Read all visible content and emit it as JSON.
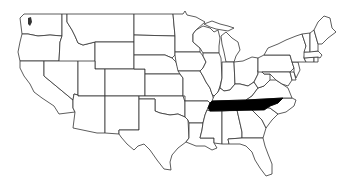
{
  "map": {
    "title": "United States map with Tennessee highlighted",
    "region": "Contiguous United States",
    "highlighted_state": "Tennessee",
    "colors": {
      "background": "#ffffff",
      "state_fill": "#ffffff",
      "state_border": "#333333",
      "highlight_fill": "#000000"
    },
    "states": [
      {
        "id": "WA",
        "name": "Washington",
        "d": "M20,18 L24,14 L62,14 L62,36 L50,35 L38,36 L28,34 L22,34 L21,26 Z"
      },
      {
        "id": "OR",
        "name": "Oregon",
        "d": "M22,34 L28,34 L38,36 L50,35 L62,36 L60,42 L59,61 L20,61 L18,52 L20,42 Z"
      },
      {
        "id": "CA",
        "name": "California",
        "d": "M20,61 L44,61 L44,76 L73,100 L73,108 L75,112 L59,114 L54,106 L42,98 L34,92 L30,84 L24,76 L20,68 Z"
      },
      {
        "id": "ID",
        "name": "Idaho",
        "d": "M62,14 L67,14 L67,22 L72,30 L75,36 L78,43 L83,45 L95,42 L95,69 L78,69 L59,69 L59,61 L60,42 L62,36 Z"
      },
      {
        "id": "NV",
        "name": "Nevada",
        "d": "M44,61 L59,61 L78,61 L78,95 L74,94 L73,100 L44,76 Z"
      },
      {
        "id": "MT",
        "name": "Montana",
        "d": "M67,14 L134,14 L134,42 L95,42 L83,45 L78,43 L75,36 L72,30 L67,22 Z"
      },
      {
        "id": "WY",
        "name": "Wyoming",
        "d": "M95,42 L134,42 L134,69 L95,69 Z"
      },
      {
        "id": "UT",
        "name": "Utah",
        "d": "M78,61 L95,61 L95,69 L105,69 L105,96 L78,96 Z"
      },
      {
        "id": "AZ",
        "name": "Arizona",
        "d": "M78,96 L105,96 L105,133 L97,133 L73,128 L75,112 L73,108 L73,100 L74,94 L78,95 Z"
      },
      {
        "id": "CO",
        "name": "Colorado",
        "d": "M105,69 L145,69 L145,96 L105,96 Z"
      },
      {
        "id": "NM",
        "name": "New Mexico",
        "d": "M105,96 L139,96 L139,130 L119,130 L119,134 L105,133 Z"
      },
      {
        "id": "ND",
        "name": "North Dakota",
        "d": "M134,14 L173,14 L175,36 L134,35 Z"
      },
      {
        "id": "SD",
        "name": "South Dakota",
        "d": "M134,35 L175,36 L175,55 L172,58 L165,55 L134,55 Z"
      },
      {
        "id": "NE",
        "name": "Nebraska",
        "d": "M134,55 L165,55 L172,58 L176,62 L180,74 L145,74 L145,69 L134,69 Z"
      },
      {
        "id": "KS",
        "name": "Kansas",
        "d": "M145,74 L180,74 L183,78 L183,96 L145,96 Z"
      },
      {
        "id": "OK",
        "name": "Oklahoma",
        "d": "M139,96 L183,96 L185,102 L185,117 L178,114 L170,115 L160,113 L155,111 L155,99 L139,99 Z"
      },
      {
        "id": "TX",
        "name": "Texas",
        "d": "M139,99 L155,99 L155,111 L160,113 L170,115 L178,114 L185,117 L188,120 L189,138 L186,142 L178,148 L172,155 L170,162 L171,170 L164,169 L157,160 L150,150 L144,144 L138,146 L134,150 L127,144 L121,137 L119,134 L119,130 L139,130 Z"
      },
      {
        "id": "MN",
        "name": "Minnesota",
        "d": "M173,14 L183,14 L185,11 L187,15 L196,17 L205,22 L196,30 L193,34 L193,42 L200,48 L200,52 L175,52 L175,36 Z"
      },
      {
        "id": "IA",
        "name": "Iowa",
        "d": "M175,52 L200,52 L203,56 L206,62 L203,68 L200,71 L178,71 L176,62 L175,55 Z"
      },
      {
        "id": "MO",
        "name": "Missouri",
        "d": "M178,71 L200,71 L203,76 L206,82 L210,88 L212,94 L214,100 L210,103 L208,101 L185,101 L185,96 L183,96 L183,78 L180,74 Z"
      },
      {
        "id": "AR",
        "name": "Arkansas",
        "d": "M185,101 L208,101 L210,103 L207,110 L205,115 L203,123 L189,123 L188,120 L185,117 Z"
      },
      {
        "id": "LA",
        "name": "Louisiana",
        "d": "M189,123 L203,123 L202,130 L200,138 L214,138 L214,143 L217,148 L212,150 L205,146 L196,146 L186,142 L189,138 Z"
      },
      {
        "id": "WI",
        "name": "Wisconsin",
        "d": "M196,30 L203,26 L210,28 L214,32 L218,30 L220,38 L219,46 L219,53 L203,53 L200,48 L193,42 L193,34 Z"
      },
      {
        "id": "IL",
        "name": "Illinois",
        "d": "M203,53 L219,53 L221,58 L222,78 L220,86 L218,92 L214,96 L212,94 L210,88 L206,82 L203,76 L200,71 L203,68 L206,62 L203,56 Z"
      },
      {
        "id": "MI",
        "name": "Michigan",
        "d": "M221,36 L226,32 L232,38 L238,42 L240,50 L236,56 L234,62 L226,62 L224,52 L222,44 Z"
      },
      {
        "id": "MIU",
        "name": "Michigan Upper Peninsula",
        "d": "M204,24 L212,21 L220,24 L228,26 L234,28 L228,31 L222,30 L216,29 L210,27 Z"
      },
      {
        "id": "IN",
        "name": "Indiana",
        "d": "M222,62 L234,62 L235,84 L230,90 L224,91 L220,88 L222,78 Z"
      },
      {
        "id": "OH",
        "name": "Ohio",
        "d": "M234,62 L243,61 L252,57 L258,58 L258,74 L254,82 L248,86 L240,84 L235,84 Z"
      },
      {
        "id": "KY",
        "name": "Kentucky",
        "d": "M214,96 L218,92 L220,88 L224,91 L230,90 L235,84 L240,84 L248,86 L254,82 L258,88 L252,96 L246,100 L212,101 Z"
      },
      {
        "id": "TN",
        "name": "Tennessee",
        "d": "M212,101 L246,100 L283,98 L278,103 L270,106 L264,110 L210,111 L208,108 L210,103 Z"
      },
      {
        "id": "MS",
        "name": "Mississippi",
        "d": "M210,111 L222,111 L222,144 L214,143 L214,138 L200,138 L202,130 L203,123 L205,115 L207,110 Z"
      },
      {
        "id": "AL",
        "name": "Alabama",
        "d": "M222,111 L237,110 L242,132 L242,138 L228,139 L229,144 L222,144 Z"
      },
      {
        "id": "GA",
        "name": "Georgia",
        "d": "M237,110 L251,109 L256,114 L262,120 L266,128 L263,138 L250,138 L242,138 L242,132 Z"
      },
      {
        "id": "FL",
        "name": "Florida",
        "d": "M228,139 L242,138 L250,138 L263,138 L265,146 L268,154 L272,164 L272,174 L266,176 L260,168 L255,160 L252,152 L246,146 L240,144 L234,144 L229,144 Z"
      },
      {
        "id": "SC",
        "name": "South Carolina",
        "d": "M251,109 L262,107 L270,108 L278,114 L272,120 L266,128 L262,120 L256,114 Z"
      },
      {
        "id": "NC",
        "name": "North Carolina",
        "d": "M264,110 L270,106 L278,103 L283,98 L292,98 L296,100 L294,106 L286,112 L278,114 L270,108 L262,107 Z"
      },
      {
        "id": "VA",
        "name": "Virginia",
        "d": "M246,100 L252,96 L258,88 L264,86 L270,80 L276,80 L282,84 L288,88 L292,98 L283,98 Z"
      },
      {
        "id": "WV",
        "name": "West Virginia",
        "d": "M254,82 L258,74 L258,70 L262,72 L264,74 L270,74 L270,80 L264,86 L258,88 Z"
      },
      {
        "id": "PA",
        "name": "Pennsylvania",
        "d": "M258,58 L264,55 L290,55 L292,62 L294,68 L290,72 L258,72 Z"
      },
      {
        "id": "MD",
        "name": "Maryland",
        "d": "M262,72 L290,72 L292,80 L288,86 L282,84 L276,80 L270,74 L264,74 Z"
      },
      {
        "id": "DE",
        "name": "Delaware",
        "d": "M290,72 L294,72 L296,80 L292,80 Z"
      },
      {
        "id": "NJ",
        "name": "New Jersey",
        "d": "M292,62 L298,62 L300,70 L296,78 L294,72 L294,68 Z"
      },
      {
        "id": "NY",
        "name": "New York",
        "d": "M264,55 L268,48 L278,44 L286,40 L296,36 L302,34 L306,46 L304,58 L306,62 L298,62 L292,62 L290,55 Z"
      },
      {
        "id": "CT",
        "name": "Connecticut",
        "d": "M304,58 L314,57 L314,62 L306,62 Z"
      },
      {
        "id": "RI",
        "name": "Rhode Island",
        "d": "M314,57 L318,57 L318,62 L314,62 Z"
      },
      {
        "id": "MA",
        "name": "Massachusetts",
        "d": "M304,52 L318,51 L322,55 L320,58 L318,57 L304,58 Z"
      },
      {
        "id": "VT",
        "name": "Vermont",
        "d": "M302,34 L310,33 L310,52 L304,52 L306,46 Z"
      },
      {
        "id": "NH",
        "name": "New Hampshire",
        "d": "M310,33 L314,30 L318,44 L318,51 L310,52 Z"
      },
      {
        "id": "ME",
        "name": "Maine",
        "d": "M314,30 L318,22 L324,16 L330,18 L332,28 L336,32 L328,38 L322,44 L318,44 Z"
      }
    ],
    "lakes": [
      {
        "name": "Puget Sound",
        "d": "M28,18 L31,17 L32,22 L30,26 L28,24 Z"
      }
    ]
  }
}
